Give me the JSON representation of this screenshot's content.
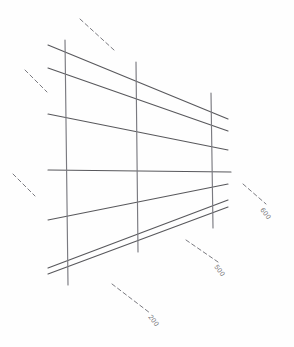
{
  "document": {
    "kind": "scanned-pencil-sketch",
    "title": "Perspective grid survey sketch",
    "background_color": "#fefefe",
    "ink_color": "#58585c",
    "ink_color_light": "#7a7a80",
    "label_color": "#5b5b5f"
  },
  "canvas": {
    "width": 294,
    "height": 347
  },
  "annotations": {
    "labels": [
      {
        "id": "label-600",
        "text": "600",
        "x": 262,
        "y": 205,
        "rotation": 52
      },
      {
        "id": "label-500",
        "text": "500",
        "x": 216,
        "y": 262,
        "rotation": 52
      },
      {
        "id": "label-200",
        "text": "200",
        "x": 150,
        "y": 312,
        "rotation": 52
      }
    ],
    "leaders": [
      {
        "id": "leader-600",
        "x1": 243,
        "y1": 184,
        "x2": 266,
        "y2": 204
      },
      {
        "id": "leader-500",
        "x1": 186,
        "y1": 240,
        "x2": 218,
        "y2": 262
      },
      {
        "id": "leader-200",
        "x1": 112,
        "y1": 284,
        "x2": 150,
        "y2": 313
      },
      {
        "id": "leader-unlabeled-top",
        "x1": 80,
        "y1": 19,
        "x2": 114,
        "y2": 50
      },
      {
        "id": "leader-unlabeled-mid",
        "x1": 25,
        "y1": 70,
        "x2": 47,
        "y2": 92
      },
      {
        "id": "leader-unlabeled-low",
        "x1": 13,
        "y1": 174,
        "x2": 35,
        "y2": 196
      }
    ]
  },
  "grid": {
    "verticals": [
      {
        "id": "vertical-left",
        "x1": 65,
        "y1": 40,
        "x2": 68,
        "y2": 285
      },
      {
        "id": "vertical-middle",
        "x1": 136,
        "y1": 62,
        "x2": 138,
        "y2": 252
      },
      {
        "id": "vertical-right",
        "x1": 211,
        "y1": 93,
        "x2": 213,
        "y2": 228
      }
    ],
    "horizontals": [
      {
        "id": "horizontal-1",
        "x1": 48,
        "y1": 45,
        "x2": 228,
        "y2": 119
      },
      {
        "id": "horizontal-2",
        "x1": 48,
        "y1": 68,
        "x2": 228,
        "y2": 131
      },
      {
        "id": "horizontal-3",
        "x1": 48,
        "y1": 114,
        "x2": 228,
        "y2": 150
      },
      {
        "id": "horizontal-4",
        "x1": 48,
        "y1": 170,
        "x2": 231,
        "y2": 172
      },
      {
        "id": "horizontal-5",
        "x1": 48,
        "y1": 220,
        "x2": 228,
        "y2": 184
      },
      {
        "id": "horizontal-6",
        "x1": 48,
        "y1": 268,
        "x2": 228,
        "y2": 200
      },
      {
        "id": "horizontal-7",
        "x1": 48,
        "y1": 274,
        "x2": 228,
        "y2": 207
      }
    ]
  }
}
